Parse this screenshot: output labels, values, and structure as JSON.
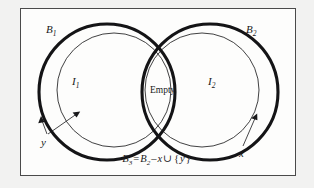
{
  "figure": {
    "type": "venn-diagram",
    "background_color": "#f2f2f1",
    "panel_color": "#fdfdfc",
    "border_color": "#4a4a4a",
    "stroke_color": "#18181a",
    "labels": {
      "b1": {
        "base": "B",
        "sub": "1"
      },
      "b2": {
        "base": "B",
        "sub": "2"
      },
      "i1": {
        "base": "I",
        "sub": "1"
      },
      "i2": {
        "base": "I",
        "sub": "2"
      },
      "empty": "Empty",
      "x": "x",
      "y": "y"
    },
    "equation": {
      "lhs_base": "B",
      "lhs_sub": "3",
      "equals": "=",
      "rhs_base": "B",
      "rhs_sub": "2",
      "minus": "–",
      "var_x": "x",
      "union": "∪",
      "brace_open": "{",
      "var_y": "y",
      "brace_close": "}"
    },
    "annotations": [
      {
        "name": "y-arrow-to-outer-circle",
        "label": "y"
      },
      {
        "name": "y-arrow-to-inner-circle",
        "label": "y"
      },
      {
        "name": "x-arrow-to-outer-circle",
        "label": "x"
      }
    ],
    "circles": [
      {
        "name": "B1",
        "cx": 107,
        "cy": 92,
        "r": 68,
        "weight": "thick"
      },
      {
        "name": "I1",
        "cx": 114,
        "cy": 90,
        "r": 57,
        "weight": "thin"
      },
      {
        "name": "B2",
        "cx": 210,
        "cy": 92,
        "r": 68,
        "weight": "thick"
      },
      {
        "name": "I2",
        "cx": 202,
        "cy": 90,
        "r": 57,
        "weight": "thin"
      }
    ]
  }
}
